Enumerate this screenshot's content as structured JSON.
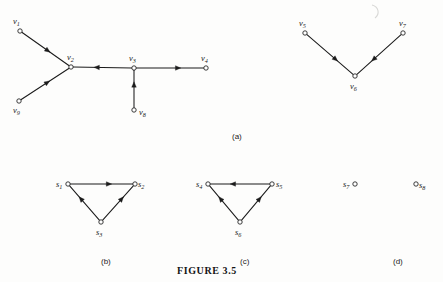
{
  "figure": {
    "caption": "FIGURE 3.5",
    "panel_labels": [
      {
        "text": "(a)",
        "x": 232,
        "y": 133
      },
      {
        "text": "(b)",
        "x": 101,
        "y": 258
      },
      {
        "text": "(c)",
        "x": 240,
        "y": 258
      },
      {
        "text": "(d)",
        "x": 393,
        "y": 258
      }
    ],
    "ink_color": "#1b1b1b",
    "node_fill": "#ffffff",
    "background": "#fdfdfc"
  },
  "chart_data": {
    "type": "diagram",
    "title": "FIGURE 3.5",
    "subtype": "directed-graph",
    "panels": [
      {
        "id": "a",
        "label": "(a)",
        "nodes": [
          {
            "id": "v1",
            "label": "v",
            "sub": "1",
            "x": 20,
            "y": 31,
            "label_x": 13,
            "label_y": 17
          },
          {
            "id": "v2",
            "label": "v",
            "sub": "2",
            "x": 71,
            "y": 67,
            "label_x": 67,
            "label_y": 53
          },
          {
            "id": "v3",
            "label": "v",
            "sub": "3",
            "x": 134,
            "y": 68,
            "label_x": 129,
            "label_y": 54
          },
          {
            "id": "v4",
            "label": "v",
            "sub": "4",
            "x": 206,
            "y": 68,
            "label_x": 201,
            "label_y": 54
          },
          {
            "id": "v8",
            "label": "v",
            "sub": "8",
            "x": 134,
            "y": 110,
            "label_x": 139,
            "label_y": 108
          },
          {
            "id": "v9",
            "label": "v",
            "sub": "9",
            "x": 19,
            "y": 101,
            "label_x": 13,
            "label_y": 106
          }
        ],
        "edges": [
          {
            "from": "v1",
            "to": "v2",
            "arrow_at": 0.55
          },
          {
            "from": "v9",
            "to": "v2",
            "arrow_at": 0.55
          },
          {
            "from": "v3",
            "to": "v2",
            "arrow_at": 0.6
          },
          {
            "from": "v3",
            "to": "v4",
            "arrow_at": 0.62
          },
          {
            "from": "v8",
            "to": "v3",
            "arrow_at": 0.62
          }
        ]
      },
      {
        "id": "a2",
        "label": "",
        "nodes": [
          {
            "id": "v5",
            "label": "v",
            "sub": "5",
            "x": 305,
            "y": 33,
            "label_x": 299,
            "label_y": 19
          },
          {
            "id": "v6",
            "label": "v",
            "sub": "6",
            "x": 355,
            "y": 76,
            "label_x": 350,
            "label_y": 82
          },
          {
            "id": "v7",
            "label": "v",
            "sub": "7",
            "x": 403,
            "y": 33,
            "label_x": 399,
            "label_y": 19
          }
        ],
        "edges": [
          {
            "from": "v5",
            "to": "v6",
            "arrow_at": 0.62
          },
          {
            "from": "v7",
            "to": "v6",
            "arrow_at": 0.62
          }
        ]
      },
      {
        "id": "b",
        "label": "(b)",
        "nodes": [
          {
            "id": "s1",
            "label": "s",
            "sub": "1",
            "x": 68,
            "y": 184,
            "label_x": 56,
            "label_y": 180
          },
          {
            "id": "s2",
            "label": "s",
            "sub": "2",
            "x": 135,
            "y": 184,
            "label_x": 138,
            "label_y": 180
          },
          {
            "id": "s3",
            "label": "s",
            "sub": "3",
            "x": 101,
            "y": 222,
            "label_x": 96,
            "label_y": 228
          }
        ],
        "edges": [
          {
            "from": "s1",
            "to": "s2",
            "arrow_at": 0.62
          },
          {
            "from": "s3",
            "to": "s1",
            "arrow_at": 0.62
          },
          {
            "from": "s3",
            "to": "s2",
            "arrow_at": 0.62
          }
        ]
      },
      {
        "id": "c",
        "label": "(c)",
        "nodes": [
          {
            "id": "s4",
            "label": "s",
            "sub": "4",
            "x": 208,
            "y": 184,
            "label_x": 196,
            "label_y": 180
          },
          {
            "id": "s5",
            "label": "s",
            "sub": "5",
            "x": 272,
            "y": 184,
            "label_x": 276,
            "label_y": 180
          },
          {
            "id": "s6",
            "label": "s",
            "sub": "6",
            "x": 240,
            "y": 222,
            "label_x": 235,
            "label_y": 228
          }
        ],
        "edges": [
          {
            "from": "s5",
            "to": "s4",
            "arrow_at": 0.62
          },
          {
            "from": "s6",
            "to": "s4",
            "arrow_at": 0.62
          },
          {
            "from": "s6",
            "to": "s5",
            "arrow_at": 0.62
          }
        ]
      },
      {
        "id": "d",
        "label": "(d)",
        "nodes": [
          {
            "id": "s7",
            "label": "s",
            "sub": "7",
            "x": 355,
            "y": 184,
            "label_x": 343,
            "label_y": 180
          },
          {
            "id": "s8",
            "label": "s",
            "sub": "8",
            "x": 416,
            "y": 184,
            "label_x": 419,
            "label_y": 181
          }
        ],
        "edges": []
      }
    ]
  }
}
